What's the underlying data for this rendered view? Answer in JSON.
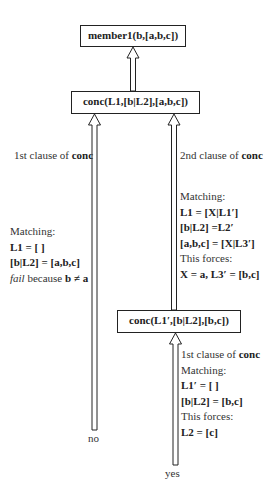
{
  "nodes": {
    "root": {
      "label": "member1(b,[a,b,c])"
    },
    "conc1": {
      "label": "conc(L1,[b|L2],[a,b,c])"
    },
    "conc2": {
      "label": "conc(L1′,[b|L2],[b,c])"
    }
  },
  "left_branch": {
    "title_prefix": "1st clause of ",
    "title_bold": "conc",
    "matching_label": "Matching:",
    "eq1": "L1 = [ ]",
    "eq2": "[b|L2] = [a,b,c]",
    "fail_italic": "fail",
    "fail_rest": " because ",
    "fail_bold": "b ≠ a",
    "result": "no"
  },
  "right_branch": {
    "title_prefix": "2nd clause of ",
    "title_bold": "conc",
    "matching_label": "Matching:",
    "eq1": "L1 = [X|L1′]",
    "eq2": "[b|L2] =L2′",
    "eq3": "[a,b,c] = [X|L3′]",
    "forces_label": "This forces:",
    "forces_eq": "X = a, L3′ = [b,c]"
  },
  "bottom_branch": {
    "title_prefix": "1st clause of ",
    "title_bold": "conc",
    "matching_label": "Matching:",
    "eq1": "L1′ = [ ]",
    "eq2": "[b|L2] = [b,c]",
    "forces_label": "This forces:",
    "forces_eq": "L2 = [c]",
    "result": "yes"
  }
}
